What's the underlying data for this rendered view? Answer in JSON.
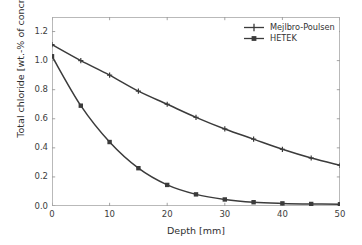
{
  "chart_data": {
    "type": "line",
    "title": "",
    "xlabel": "Depth [mm]",
    "ylabel": "Total chloride [wt.-% of concrete]",
    "xlim": [
      0,
      50
    ],
    "ylim": [
      0.0,
      1.3
    ],
    "grid": false,
    "legend_position": "upper right",
    "xticks": [
      0,
      10,
      20,
      30,
      40,
      50
    ],
    "xtick_labels": [
      "0",
      "10",
      "20",
      "30",
      "40",
      "50"
    ],
    "yticks": [
      0.0,
      0.2,
      0.4,
      0.6,
      0.8,
      1.0,
      1.2
    ],
    "ytick_labels": [
      "0.0",
      "0.2",
      "0.4",
      "0.6",
      "0.8",
      "1.0",
      "1.2"
    ],
    "x": [
      0,
      5,
      10,
      15,
      20,
      25,
      30,
      35,
      40,
      45,
      50
    ],
    "series": [
      {
        "name": "Mejlbro-Poulsen",
        "marker": "plus",
        "color": "#3b3b3b",
        "values": [
          1.11,
          1.0,
          0.9,
          0.79,
          0.7,
          0.61,
          0.53,
          0.46,
          0.39,
          0.33,
          0.28
        ]
      },
      {
        "name": "HETEK",
        "marker": "square",
        "color": "#3b3b3b",
        "values": [
          1.03,
          0.69,
          0.44,
          0.26,
          0.145,
          0.08,
          0.045,
          0.026,
          0.018,
          0.014,
          0.012
        ]
      }
    ]
  },
  "axes": {
    "xlabel": "Depth [mm]",
    "ylabel": "Total chloride [wt.-% of concrete]"
  },
  "legend": {
    "items": [
      {
        "label": "Mejlbro-Poulsen"
      },
      {
        "label": "HETEK"
      }
    ]
  }
}
